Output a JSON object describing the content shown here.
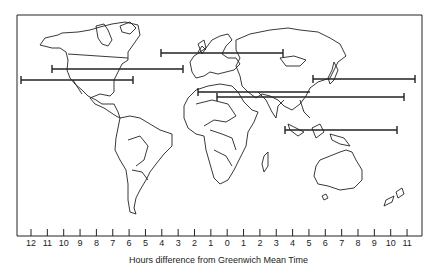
{
  "map": {
    "title": "World time zones",
    "frame": {
      "left": 17,
      "top": 15,
      "right": 422,
      "bottom": 236
    },
    "axis": {
      "title": "Hours difference from Greenwich Mean Time",
      "tick_labels": [
        "12",
        "11",
        "10",
        "9",
        "8",
        "7",
        "6",
        "5",
        "4",
        "3",
        "2",
        "1",
        "0",
        "1",
        "2",
        "3",
        "4",
        "5",
        "6",
        "7",
        "8",
        "9",
        "10",
        "11"
      ],
      "first_tick_x": 31,
      "tick_spacing": 16.35
    },
    "range_bars": [
      {
        "region": "Europe",
        "x1": 161,
        "x2": 283,
        "y": 53
      },
      {
        "region": "North America (north)",
        "x1": 52,
        "x2": 183,
        "y": 69
      },
      {
        "region": "North America (south)",
        "x1": 21,
        "x2": 133,
        "y": 80
      },
      {
        "region": "East Asia",
        "x1": 313,
        "x2": 415,
        "y": 79
      },
      {
        "region": "Middle East",
        "x1": 198,
        "x2": 310,
        "y": 92
      },
      {
        "region": "South Asia",
        "x1": 217,
        "x2": 404,
        "y": 97
      },
      {
        "region": "Southeast Asia",
        "x1": 285,
        "x2": 397,
        "y": 130
      }
    ],
    "colors": {
      "line": "#222222",
      "background": "#ffffff"
    }
  }
}
